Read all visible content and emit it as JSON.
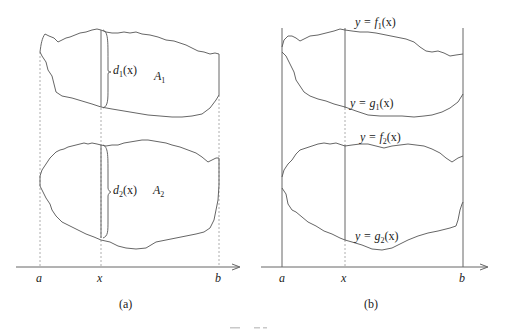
{
  "figure": {
    "panels": [
      {
        "id": "a",
        "caption": "(a)",
        "labels": {
          "d1": "d",
          "d1_sub": "1",
          "d1_arg": "(x)",
          "A1": "A",
          "A1_sub": "1",
          "d2": "d",
          "d2_sub": "2",
          "d2_arg": "(x)",
          "A2": "A",
          "A2_sub": "2"
        },
        "axis_ticks": [
          "a",
          "x",
          "b"
        ]
      },
      {
        "id": "b",
        "caption": "(b)",
        "labels": {
          "f1_pre": "y = f",
          "f1_sub": "1",
          "f1_arg": "(x)",
          "g1_pre": "y = g",
          "g1_sub": "1",
          "g1_arg": "(x)",
          "f2_pre": "y = f",
          "f2_sub": "2",
          "f2_arg": "(x)",
          "g2_pre": "y = g",
          "g2_sub": "2",
          "g2_arg": "(x)"
        },
        "axis_ticks": [
          "a",
          "x",
          "b"
        ]
      }
    ]
  }
}
